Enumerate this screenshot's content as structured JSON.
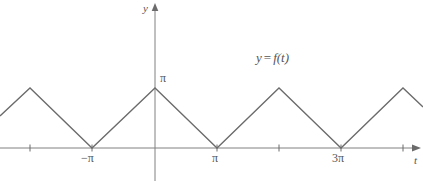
{
  "figure": {
    "title": "",
    "axis_labels": {
      "y": "y",
      "t": "t"
    },
    "function_label": {
      "lhs": "y",
      "operator": "=",
      "rhs": "f(t)",
      "full": "y = f(t)"
    },
    "y_tick_label": "π",
    "x_tick_labels": [
      "−π",
      "π",
      "3π"
    ],
    "colors": {
      "curve": "#6b6b6b",
      "axis": "#808080",
      "text": "#555555",
      "background": "#ffffff"
    }
  },
  "chart_data": {
    "type": "line",
    "title": "",
    "subtitle": "",
    "xlabel": "t",
    "ylabel": "y",
    "legend": [
      "y = f(t)"
    ],
    "legend_position": "inside-upper-right",
    "grid": false,
    "annotations": [
      "y = f(t)"
    ],
    "xlim": [
      -5.0,
      8.4
    ],
    "ylim": [
      0,
      3.6
    ],
    "x_ticks": [
      -2.0,
      -3.14159,
      0,
      3.14159,
      4.71239,
      9.42478,
      11.0
    ],
    "x_tick_labels": [
      "",
      "−π",
      "",
      "π",
      "",
      "3π",
      ""
    ],
    "y_ticks": [
      3.14159
    ],
    "y_tick_labels": [
      "π"
    ],
    "period": 6.28319,
    "amplitude": 3.14159,
    "series": [
      {
        "name": "y = f(t)",
        "x": [
          -5.0,
          -2.0,
          -3.14159,
          0,
          3.14159,
          4.71239,
          9.42478,
          11.0,
          8.4
        ],
        "points_px": [
          [
            0,
            116
          ],
          [
            30,
            88
          ],
          [
            92,
            148
          ],
          [
            155,
            88
          ],
          [
            217,
            148
          ],
          [
            279,
            88
          ],
          [
            341,
            148
          ],
          [
            403,
            88
          ],
          [
            423,
            107
          ]
        ],
        "values": [
          1.6,
          3.14159,
          0,
          3.14159,
          0,
          3.14159,
          0,
          3.14159,
          2.1
        ]
      }
    ]
  }
}
